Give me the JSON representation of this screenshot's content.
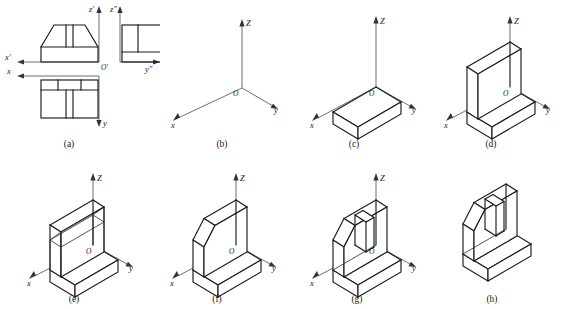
{
  "figure": {
    "panel_count": 8
  },
  "panels": [
    {
      "id": "a",
      "caption": "(a)",
      "kind": "orthographic-views",
      "axis_labels": [
        "x'",
        "z'",
        "z\"",
        "y\"",
        "x",
        "y",
        "O'"
      ],
      "views": [
        "front-view",
        "side-view",
        "top-view"
      ]
    },
    {
      "id": "b",
      "caption": "(b)",
      "kind": "isometric-axes",
      "axis_labels": [
        "Z",
        "y",
        "x",
        "O"
      ]
    },
    {
      "id": "c",
      "caption": "(c)",
      "kind": "isometric-solid",
      "axis_labels": [
        "Z",
        "y",
        "x",
        "O"
      ],
      "step": "base slab"
    },
    {
      "id": "d",
      "caption": "(d)",
      "kind": "isometric-solid",
      "axis_labels": [
        "Z",
        "y",
        "x",
        "O"
      ],
      "step": "vertical wall added"
    },
    {
      "id": "e",
      "caption": "(e)",
      "kind": "isometric-solid",
      "axis_labels": [
        "Z",
        "y",
        "x",
        "O"
      ],
      "step": "chamfer construction lines"
    },
    {
      "id": "f",
      "caption": "(f)",
      "kind": "isometric-solid",
      "axis_labels": [
        "Z",
        "y",
        "x",
        "O"
      ],
      "step": "chamfers trimmed"
    },
    {
      "id": "g",
      "caption": "(g)",
      "kind": "isometric-solid",
      "axis_labels": [
        "Z",
        "y",
        "x",
        "O"
      ],
      "step": "central slot cut"
    },
    {
      "id": "h",
      "caption": "(h)",
      "kind": "isometric-solid",
      "axis_labels": [],
      "step": "finished object, axes removed"
    }
  ],
  "colors": {
    "line": "#1b1b1b",
    "thin_line": "#2a2a2a",
    "axis": "#555555",
    "background": "#ffffff",
    "text": "#1a1a1a"
  }
}
